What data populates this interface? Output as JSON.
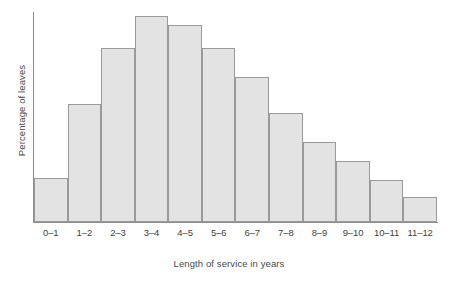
{
  "chart_data": {
    "type": "bar",
    "title": "",
    "subtitle": "",
    "xlabel": "Length of service in years",
    "ylabel": "Percentage of leaves",
    "categories": [
      "0–1",
      "1–2",
      "2–3",
      "3–4",
      "4–5",
      "5–6",
      "6–7",
      "7–8",
      "8–9",
      "9–10",
      "10–11",
      "11–12"
    ],
    "values": [
      21,
      56,
      83,
      98,
      94,
      83,
      69,
      52,
      38,
      29,
      20,
      12
    ],
    "ylim": [
      0,
      100
    ],
    "y_ticks": [],
    "grid": false,
    "legend": null,
    "bar_fill_color": "#e3e3e3",
    "bar_border_color": "#9a9a9a",
    "axis_color": "#8d8d8d",
    "background_color": "#ffffff",
    "histogram": true,
    "bar_gap": 0
  },
  "axes": {
    "y_title": "Percentage of leaves",
    "x_title": "Length of service in years"
  }
}
